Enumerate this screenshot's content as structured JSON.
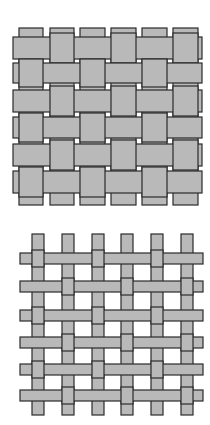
{
  "figures": [
    {
      "name": "basket-weave",
      "top": 0,
      "height": 212,
      "fill": "#b9b9b9",
      "stroke": "#2a2a2a",
      "verticals": [
        [
          19,
          43
        ],
        [
          50,
          74
        ],
        [
          80,
          105
        ],
        [
          111,
          136
        ],
        [
          142,
          167
        ],
        [
          173,
          198
        ]
      ],
      "v_top": 28,
      "v_bottom": 205,
      "rows": [
        [
          37,
          59
        ],
        [
          63,
          83
        ],
        [
          90,
          112
        ],
        [
          117,
          138
        ],
        [
          144,
          166
        ],
        [
          171,
          193
        ]
      ],
      "h_left": 13,
      "h_right": 202
    },
    {
      "name": "plain-weave",
      "top": 212,
      "height": 213,
      "fill": "#b9b9b9",
      "stroke": "#2a2a2a",
      "verticals": [
        [
          32,
          44
        ],
        [
          62,
          74
        ],
        [
          92,
          104
        ],
        [
          121,
          133
        ],
        [
          151,
          163
        ],
        [
          181,
          193
        ]
      ],
      "v_top": 22,
      "v_bottom": 203,
      "rows": [
        [
          41,
          52
        ],
        [
          69,
          80
        ],
        [
          98,
          109
        ],
        [
          125,
          136
        ],
        [
          152,
          163
        ],
        [
          178,
          189
        ]
      ],
      "h_left": 20,
      "h_right": 203
    }
  ]
}
